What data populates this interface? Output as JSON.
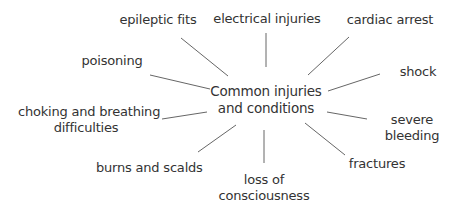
{
  "diagram": {
    "type": "mind-map",
    "center": {
      "line1": "Common injuries",
      "line2": "and conditions"
    },
    "nodes": [
      {
        "id": "epileptic-fits",
        "lines": [
          "epileptic fits"
        ]
      },
      {
        "id": "electrical-injuries",
        "lines": [
          "electrical injuries"
        ]
      },
      {
        "id": "cardiac-arrest",
        "lines": [
          "cardiac arrest"
        ]
      },
      {
        "id": "poisoning",
        "lines": [
          "poisoning"
        ]
      },
      {
        "id": "shock",
        "lines": [
          "shock"
        ]
      },
      {
        "id": "choking",
        "lines": [
          "choking and breathing",
          "difficulties"
        ]
      },
      {
        "id": "severe-bleeding",
        "lines": [
          "severe",
          "bleeding"
        ]
      },
      {
        "id": "burns-and-scalds",
        "lines": [
          "burns and scalds"
        ]
      },
      {
        "id": "fractures",
        "lines": [
          "fractures"
        ]
      },
      {
        "id": "loss-of-consciousness",
        "lines": [
          "loss of",
          "consciousness"
        ]
      }
    ],
    "colors": {
      "text": "#333333",
      "line": "#666666"
    }
  }
}
